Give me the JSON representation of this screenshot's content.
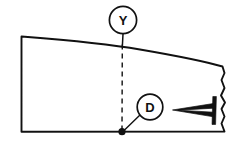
{
  "drawing": {
    "title": "Sectional technical drawing with callouts Y and D",
    "background_color": "#ffffff",
    "line_color": "#111111",
    "width": 242,
    "height": 149,
    "callouts": [
      {
        "id": "Y",
        "label": "Y",
        "shape": "circle",
        "center_x": 123,
        "center_y": 20,
        "radius": 14,
        "leader_style_upper": "solid",
        "leader_style_lower": "dashed",
        "leader_target_x": 122,
        "leader_target_y": 132
      },
      {
        "id": "D",
        "label": "D",
        "shape": "circle",
        "center_x": 150,
        "center_y": 107,
        "radius": 13,
        "leader_style": "solid",
        "leader_target_x": 122,
        "leader_target_y": 132
      }
    ],
    "body": {
      "name": "part-outline",
      "left_edge_x": 21,
      "top_left_y": 36,
      "bottom_edge_y": 132,
      "right_break_x": 225,
      "top_edge_description": "gentle downward curve to the right",
      "right_edge_description": "irregular break line"
    },
    "details": [
      {
        "name": "crack-wedge",
        "description": "thin tapered wedge pointing left",
        "tip_x": 173,
        "tip_y": 110,
        "base_x": 214,
        "base_y_top": 104,
        "base_y_bottom": 116
      },
      {
        "name": "end-bar",
        "description": "short vertical bar at right end of wedge",
        "x": 215,
        "y_top": 96,
        "y_bottom": 124
      }
    ],
    "reference_point": {
      "name": "datum-point",
      "x": 122,
      "y": 132,
      "radius": 3.6
    }
  }
}
